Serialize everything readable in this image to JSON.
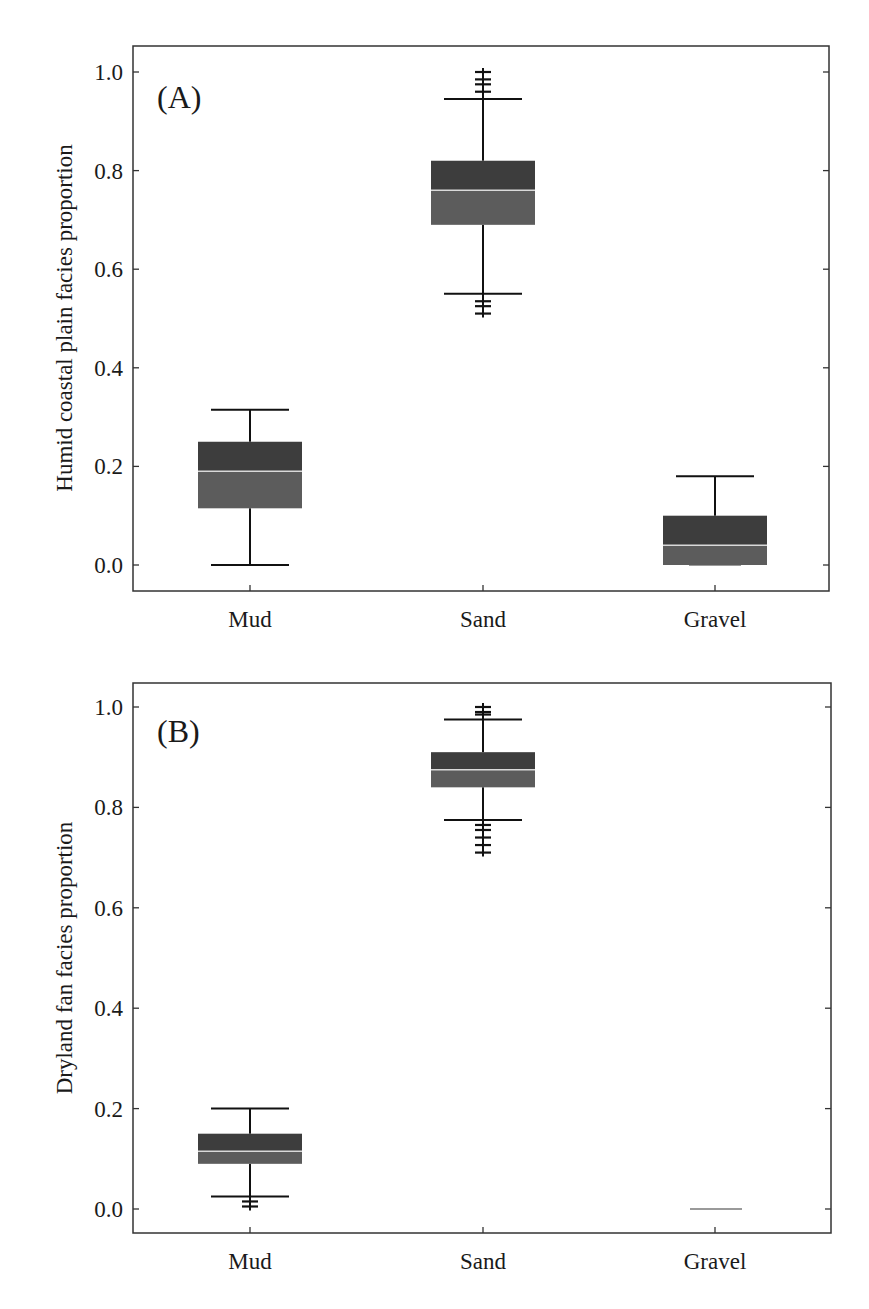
{
  "colors": {
    "box_upper": "#3d3d3d",
    "box_lower": "#5c5c5c",
    "median": "#d9d9d9",
    "whisker": "#111111",
    "frame": "#333333",
    "zero_line": "#9a9a9a"
  },
  "chart_data": [
    {
      "type": "box",
      "panel_label": "(A)",
      "title": "",
      "xlabel": "",
      "ylabel": "Humid coastal plain facies proportion",
      "categories": [
        "Mud",
        "Sand",
        "Gravel"
      ],
      "yticks": [
        "0.0",
        "0.2",
        "0.4",
        "0.6",
        "0.8",
        "1.0"
      ],
      "ylim": [
        -0.05,
        1.05
      ],
      "grid": false,
      "legend": null,
      "series": [
        {
          "name": "Mud",
          "whisker_low": 0.0,
          "q1": 0.115,
          "median": 0.19,
          "q3": 0.25,
          "whisker_high": 0.315,
          "outliers": []
        },
        {
          "name": "Sand",
          "whisker_low": 0.55,
          "q1": 0.69,
          "median": 0.76,
          "q3": 0.82,
          "whisker_high": 0.945,
          "outliers": [
            1.0,
            0.985,
            0.975,
            0.96,
            0.535,
            0.525,
            0.51
          ]
        },
        {
          "name": "Gravel",
          "whisker_low": 0.0,
          "q1": 0.0,
          "median": 0.04,
          "q3": 0.1,
          "whisker_high": 0.18,
          "outliers": []
        }
      ]
    },
    {
      "type": "box",
      "panel_label": "(B)",
      "title": "",
      "xlabel": "",
      "ylabel": "Dryland fan facies proportion",
      "categories": [
        "Mud",
        "Sand",
        "Gravel"
      ],
      "yticks": [
        "0.0",
        "0.2",
        "0.4",
        "0.6",
        "0.8",
        "1.0"
      ],
      "ylim": [
        -0.05,
        1.05
      ],
      "grid": false,
      "legend": null,
      "series": [
        {
          "name": "Mud",
          "whisker_low": 0.025,
          "q1": 0.09,
          "median": 0.115,
          "q3": 0.15,
          "whisker_high": 0.2,
          "outliers": [
            0.015,
            0.005
          ]
        },
        {
          "name": "Sand",
          "whisker_low": 0.775,
          "q1": 0.84,
          "median": 0.875,
          "q3": 0.91,
          "whisker_high": 0.975,
          "outliers": [
            1.0,
            0.99,
            0.985,
            0.765,
            0.755,
            0.74,
            0.725,
            0.71
          ]
        },
        {
          "name": "Gravel",
          "whisker_low": 0.0,
          "q1": 0.0,
          "median": 0.0,
          "q3": 0.0,
          "whisker_high": 0.0,
          "outliers": []
        }
      ]
    }
  ]
}
